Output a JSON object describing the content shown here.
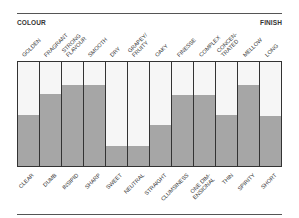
{
  "header": {
    "left_label": "COLOUR",
    "right_label": "FINISH"
  },
  "colors": {
    "fill": "#a6a6a6",
    "background": "#f6f6f6",
    "border": "#333333"
  },
  "chart_data": {
    "type": "bar",
    "title": "",
    "xlabel": "",
    "ylabel": "",
    "ylim": [
      0,
      100
    ],
    "grid": false,
    "legend": "none",
    "top_labels": [
      "GOLDEN",
      "FRAGRANT",
      "STRONG\nFLAVOUR",
      "SMOOTH",
      "DRY",
      "GRAPEY/\nFRUITY",
      "OAKY",
      "FINESSE",
      "COMPLEX",
      "CONCEN-\nTRATED",
      "MELLOW",
      "LONG"
    ],
    "categories": [
      "CLEAR",
      "DUMB",
      "INSIPID",
      "SHARP",
      "SWEET",
      "NEUTRAL",
      "STRAIGHT",
      "CLUMSINESS",
      "ONE DIM-\nENSIONAL",
      "THIN",
      "SPIRITY",
      "SHORT"
    ],
    "values": [
      49,
      69,
      78,
      78,
      19,
      19,
      39,
      68,
      68,
      49,
      78,
      48
    ],
    "axis_ends": {
      "left": "COLOUR",
      "right": "FINISH"
    }
  }
}
